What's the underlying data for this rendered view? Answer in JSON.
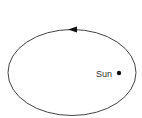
{
  "diagram": {
    "type": "orbit",
    "orbit": {
      "shape": "ellipse",
      "cx": 72,
      "cy": 72.5,
      "rx": 64,
      "ry": 43,
      "stroke": "#444444",
      "direction": "counterclockwise"
    },
    "arrow": {
      "position": "top",
      "pointing": "left",
      "color": "#111111"
    },
    "sun": {
      "label": "Sun",
      "dot_x": 119,
      "dot_y": 73,
      "dot_color": "#111111"
    }
  }
}
